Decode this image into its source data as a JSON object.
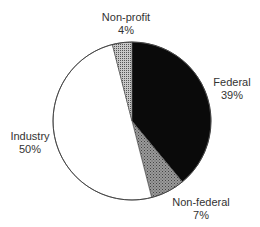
{
  "chart_data": {
    "type": "pie",
    "title": "",
    "categories": [
      "Federal",
      "Non-federal",
      "Industry",
      "Non-profit"
    ],
    "values": [
      39,
      7,
      50,
      4
    ],
    "value_labels": [
      "39%",
      "7%",
      "50%",
      "4%"
    ],
    "series": [
      {
        "name": "Share",
        "values": [
          39,
          7,
          50,
          4
        ]
      }
    ],
    "fills": {
      "Federal": "#0a0a0a",
      "Non-federal": "dotted gray pattern",
      "Industry": "#ffffff",
      "Non-profit": "fine grid gray pattern"
    },
    "start_angle": "12 o'clock",
    "direction": "clockwise",
    "legend": "none (labels adjacent to slices)"
  },
  "labels": {
    "nonprofit": {
      "name": "Non-profit",
      "pct": "4%"
    },
    "federal": {
      "name": "Federal",
      "pct": "39%"
    },
    "nonfederal": {
      "name": "Non-federal",
      "pct": "7%"
    },
    "industry": {
      "name": "Industry",
      "pct": "50%"
    }
  }
}
